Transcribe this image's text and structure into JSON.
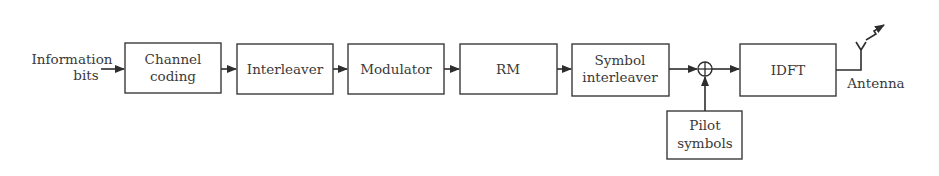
{
  "diagram": {
    "type": "block-diagram",
    "input": {
      "line1": "Information",
      "line2": "bits"
    },
    "blocks": [
      {
        "id": "channel-coding",
        "line1": "Channel",
        "line2": "coding"
      },
      {
        "id": "interleaver",
        "line1": "Interleaver"
      },
      {
        "id": "modulator",
        "line1": "Modulator"
      },
      {
        "id": "rm",
        "line1": "RM"
      },
      {
        "id": "symbol-interleaver",
        "line1": "Symbol",
        "line2": "interleaver"
      },
      {
        "id": "idft",
        "line1": "IDFT"
      }
    ],
    "adder": {
      "symbol": "⊕"
    },
    "pilot": {
      "line1": "Pilot",
      "line2": "symbols"
    },
    "output": {
      "label": "Antenna"
    },
    "colors": {
      "stroke": "#2e2e2e",
      "text": "#3a3a3a",
      "background": "#ffffff"
    }
  }
}
